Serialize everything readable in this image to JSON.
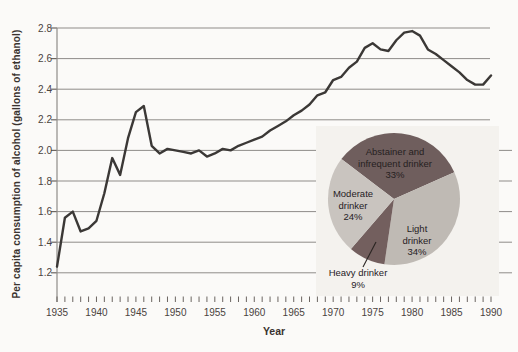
{
  "colors": {
    "line": "#3b3836",
    "grid": "#8f8c89",
    "tick": "#6b6561",
    "tick_text": "#4a433e",
    "title_text": "#3a332f",
    "inset_bg": "#f4f2ee",
    "page_bg": "#fbfaf8",
    "pie_dark": "#6f5e5d",
    "pie_light": "#bfbab4",
    "callout": "#2a2522"
  },
  "chart_data": [
    {
      "type": "line",
      "title": "",
      "xlabel": "Year",
      "ylabel": "Per capita consumption of alcohol (gallons of ethanol)",
      "grid": true,
      "xlim": [
        1935,
        1990
      ],
      "ylim": [
        1.0,
        2.8
      ],
      "y_ticks": [
        1.2,
        1.4,
        1.6,
        1.8,
        2.0,
        2.2,
        2.4,
        2.6,
        2.8
      ],
      "x_tick_labels": [
        1935,
        1940,
        1945,
        1950,
        1955,
        1960,
        1965,
        1970,
        1975,
        1980,
        1985,
        1990
      ],
      "x": [
        1935,
        1936,
        1937,
        1938,
        1939,
        1940,
        1941,
        1942,
        1943,
        1944,
        1945,
        1946,
        1947,
        1948,
        1949,
        1950,
        1951,
        1952,
        1953,
        1954,
        1955,
        1956,
        1957,
        1958,
        1959,
        1960,
        1961,
        1962,
        1963,
        1964,
        1965,
        1966,
        1967,
        1968,
        1969,
        1970,
        1971,
        1972,
        1973,
        1974,
        1975,
        1976,
        1977,
        1978,
        1979,
        1980,
        1981,
        1982,
        1983,
        1984,
        1985,
        1986,
        1987,
        1988,
        1989,
        1990
      ],
      "y": [
        1.24,
        1.56,
        1.6,
        1.47,
        1.49,
        1.54,
        1.72,
        1.95,
        1.84,
        2.08,
        2.25,
        2.29,
        2.03,
        1.98,
        2.01,
        2.0,
        1.99,
        1.98,
        2.0,
        1.96,
        1.98,
        2.01,
        2.0,
        2.03,
        2.05,
        2.07,
        2.09,
        2.13,
        2.16,
        2.19,
        2.23,
        2.26,
        2.3,
        2.36,
        2.38,
        2.46,
        2.48,
        2.54,
        2.58,
        2.67,
        2.7,
        2.66,
        2.65,
        2.72,
        2.77,
        2.78,
        2.75,
        2.66,
        2.63,
        2.59,
        2.55,
        2.51,
        2.46,
        2.43,
        2.43,
        2.49
      ]
    },
    {
      "type": "pie",
      "legend_position": "inset lower right",
      "start_deg": 142.8,
      "labels": [
        "Abstainer and infrequent drinker",
        "Light drinker",
        "Heavy drinker",
        "Moderate drinker"
      ],
      "values": [
        33,
        34,
        9,
        24
      ],
      "slice_colors": [
        "#6f5e5d",
        "#bfbab4",
        "#735f5e",
        "#c9c4bf"
      ],
      "slice_display": {
        "abstainer": "Abstainer and\ninfrequent drinker\n33%",
        "light": "Light\ndrinker\n34%",
        "heavy": "Heavy drinker\n9%",
        "moderate": "Moderate\ndrinker\n24%"
      }
    }
  ]
}
